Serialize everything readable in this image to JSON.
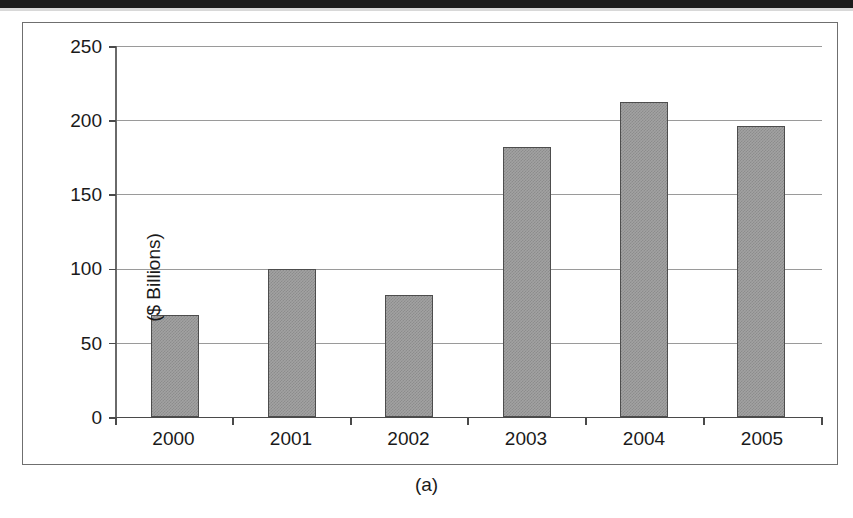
{
  "figure": {
    "caption": "(a)",
    "frame_color": "#6f6f6f"
  },
  "chart_data": {
    "type": "bar",
    "title": "",
    "subtitle": "",
    "xlabel": "",
    "ylabel": "($ Billions)",
    "categories": [
      "2000",
      "2001",
      "2002",
      "2003",
      "2004",
      "2005"
    ],
    "values": [
      69,
      100,
      82,
      182,
      212,
      196
    ],
    "series": [
      {
        "name": "",
        "values": [
          69,
          100,
          82,
          182,
          212,
          196
        ]
      }
    ],
    "ylim": [
      0,
      250
    ],
    "yticks": [
      0,
      50,
      100,
      150,
      200,
      250
    ],
    "ytick_labels": [
      "0",
      "50",
      "100",
      "150",
      "200",
      "250"
    ],
    "xtick_labels": [
      "2000",
      "2001",
      "2002",
      "2003",
      "2004",
      "2005"
    ],
    "grid": true,
    "grid_axis": "y",
    "legend": false,
    "legend_position": "none",
    "bar_fill": "#a2a2a2",
    "bar_edge": "#4d4d4d",
    "gridline_color": "#9a9a9a",
    "axis_color": "#4a4a4a",
    "annotations": []
  }
}
